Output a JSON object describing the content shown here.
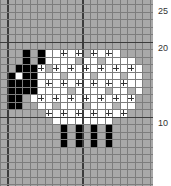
{
  "chart_data": {
    "type": "heatmap",
    "title": "",
    "grid": {
      "cell_px": 7.5,
      "x_offset_px": 0,
      "y_offset_px": 4.5,
      "cols": 21,
      "row_min": -1,
      "row_max": 24,
      "thick_cols": [
        1,
        11
      ],
      "thick_rows": [
        5,
        15
      ]
    },
    "row_labels": [
      {
        "label": "25",
        "row_line": 0
      },
      {
        "label": "20",
        "row_line": 5
      },
      {
        "label": "10",
        "row_line": 15
      }
    ],
    "colors": {
      "background": "#a9a9a9",
      "white": "#ffffff",
      "black": "#000000",
      "grey": "#b4b4b4",
      "grid_line": "#7d7d7d",
      "thick_line": "#3c3c3c"
    },
    "legend": [
      {
        "symbol": "white",
        "meaning": "body (white)"
      },
      {
        "symbol": "black",
        "meaning": "head, ears, legs (black)"
      },
      {
        "symbol": "plus",
        "meaning": "stitch mark (+)"
      }
    ],
    "white_rows": [
      {
        "row": 6,
        "from": 6,
        "to": 15
      },
      {
        "row": 7,
        "from": 5,
        "to": 17
      },
      {
        "row": 8,
        "from": 5,
        "to": 18
      },
      {
        "row": 9,
        "from": 5,
        "to": 18
      },
      {
        "row": 10,
        "from": 5,
        "to": 18
      },
      {
        "row": 11,
        "from": 5,
        "to": 18
      },
      {
        "row": 12,
        "from": 4,
        "to": 17
      },
      {
        "row": 13,
        "from": 5,
        "to": 17
      },
      {
        "row": 14,
        "from": 6,
        "to": 16
      },
      {
        "row": 15,
        "from": 7,
        "to": 14
      },
      {
        "row": 9,
        "from": 2,
        "to": 2
      }
    ],
    "grey_cells": [
      [
        6,
        11
      ],
      [
        7,
        10
      ],
      [
        7,
        13
      ],
      [
        8,
        6
      ],
      [
        9,
        8
      ],
      [
        9,
        12
      ],
      [
        9,
        16
      ],
      [
        11,
        9
      ],
      [
        11,
        14
      ],
      [
        11,
        17
      ],
      [
        13,
        7
      ],
      [
        13,
        11
      ],
      [
        13,
        15
      ]
    ],
    "black_cells": [
      [
        6,
        3
      ],
      [
        6,
        5
      ],
      [
        7,
        3
      ],
      [
        7,
        5
      ],
      [
        8,
        2
      ],
      [
        8,
        3
      ],
      [
        8,
        4
      ],
      [
        9,
        1
      ],
      [
        9,
        3
      ],
      [
        9,
        4
      ],
      [
        10,
        1
      ],
      [
        10,
        2
      ],
      [
        10,
        3
      ],
      [
        10,
        4
      ],
      [
        11,
        1
      ],
      [
        11,
        2
      ],
      [
        11,
        3
      ],
      [
        11,
        4
      ],
      [
        12,
        1
      ],
      [
        12,
        2
      ],
      [
        13,
        1
      ],
      [
        13,
        2
      ],
      [
        16,
        8
      ],
      [
        16,
        10
      ],
      [
        16,
        12
      ],
      [
        16,
        14
      ],
      [
        17,
        8
      ],
      [
        17,
        10
      ],
      [
        17,
        12
      ],
      [
        17,
        14
      ],
      [
        18,
        8
      ],
      [
        18,
        10
      ],
      [
        18,
        12
      ],
      [
        18,
        14
      ]
    ],
    "plus_cells": [
      {
        "row": 6,
        "cols": [
          8,
          10,
          12,
          14
        ]
      },
      {
        "row": 8,
        "cols": [
          5,
          7,
          9,
          11,
          13,
          15,
          17
        ]
      },
      {
        "row": 10,
        "cols": [
          6,
          8,
          10,
          12,
          14,
          16
        ]
      },
      {
        "row": 12,
        "cols": [
          5,
          7,
          9,
          11,
          13,
          15,
          17
        ]
      },
      {
        "row": 14,
        "cols": [
          6,
          8,
          10,
          12,
          14,
          16
        ]
      }
    ]
  }
}
